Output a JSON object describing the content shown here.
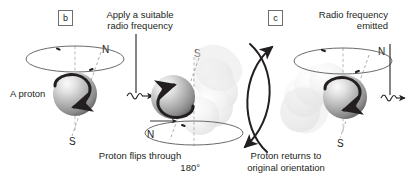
{
  "figure": {
    "background": "#ffffff",
    "ink": "#231f20",
    "sphere_light": "#f2f2f2",
    "sphere_mid": "#b3b3b3",
    "sphere_dark": "#6e6e6e",
    "ghost": "#d9d9d9"
  },
  "panels": [
    {
      "tag": "b",
      "heading": null,
      "caption": null,
      "label": "A proton",
      "pole_top": "N",
      "pole_bottom": "S"
    },
    {
      "tag": null,
      "heading_line1": "Apply a suitable",
      "heading_line2": "radio frequency",
      "caption_line1": "Proton flips through",
      "caption_line2": "180°",
      "pole_top": "S",
      "pole_bottom": "N"
    },
    {
      "tag": "c",
      "heading_line1": "Radio frequency",
      "heading_line2": "emitted",
      "caption_line1": "Proton returns to",
      "caption_line2": "original orientation",
      "pole_top": "N",
      "pole_bottom": "S"
    }
  ],
  "icons": {
    "rf_in": "radio-frequency-input-arrow",
    "rf_out": "radio-frequency-emitted-arrow",
    "flip": "flip-curved-arrow",
    "return": "return-curved-arrow",
    "spin": "spin-arrow",
    "precession": "precession-ellipse"
  }
}
